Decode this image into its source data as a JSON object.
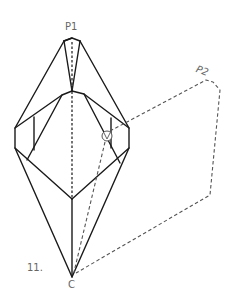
{
  "diagram": {
    "type": "origami-fold-step",
    "step_number": "11.",
    "labels": {
      "p1": "P1",
      "p2": "P2",
      "c": "C"
    },
    "symbols": [
      {
        "name": "crimp-fold-marker",
        "shape": "circle",
        "position": [
          107,
          136
        ]
      }
    ],
    "colors": {
      "line": "#1a1a1a",
      "dashed": "#555555",
      "label": "#666666",
      "background": "#ffffff"
    }
  }
}
